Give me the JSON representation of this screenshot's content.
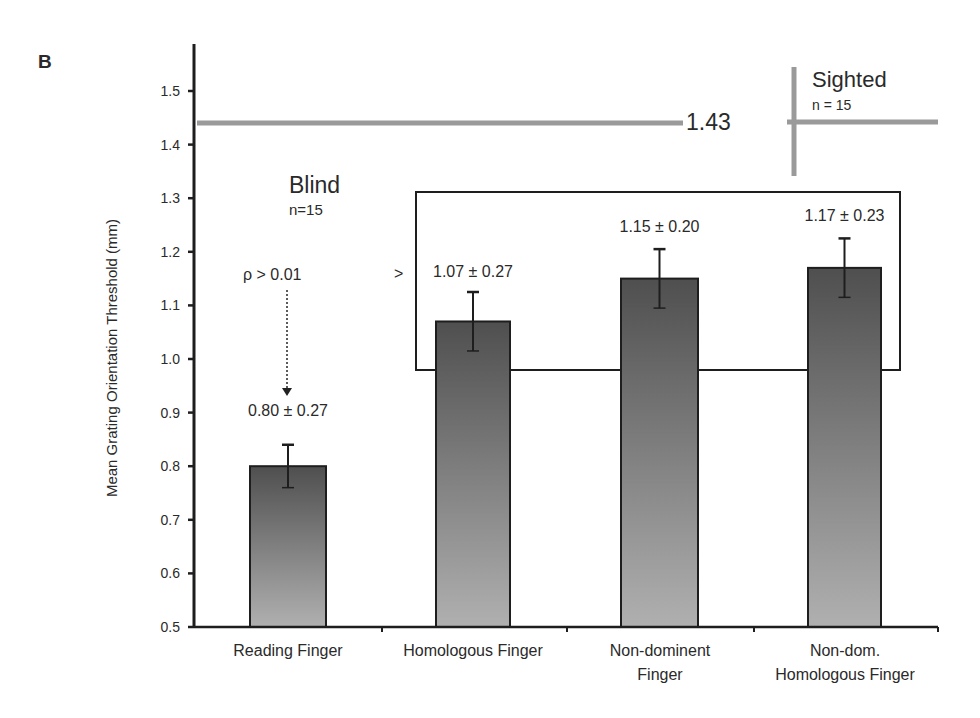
{
  "panel_label": "B",
  "chart_data": {
    "type": "bar",
    "title": "",
    "xlabel": "",
    "ylabel": "Mean Grating Orientation Threshold (mm)",
    "ylim": [
      0.5,
      1.55
    ],
    "yticks": [
      "0.5",
      "0.6",
      "0.7",
      "0.8",
      "0.9",
      "1.0",
      "1.1",
      "1.2",
      "1.3",
      "1.4",
      "1.5"
    ],
    "grid": false,
    "categories": [
      "Reading Finger",
      "Homologous Finger",
      "Non-dominent Finger",
      "Non-dom. Homologous Finger"
    ],
    "category_lines": [
      [
        "Reading Finger"
      ],
      [
        "Homologous Finger"
      ],
      [
        "Non-dominent",
        "Finger"
      ],
      [
        "Non-dom.",
        "Homologous Finger"
      ]
    ],
    "values": [
      0.8,
      1.07,
      1.15,
      1.17
    ],
    "errors_display": [
      0.27,
      0.27,
      0.2,
      0.23
    ],
    "error_bars_plotted": [
      0.04,
      0.055,
      0.055,
      0.055
    ],
    "data_labels": [
      "0.80 ± 0.27",
      "1.07 ± 0.27",
      "1.15 ± 0.20",
      "1.17 ± 0.23"
    ],
    "reference_line": {
      "value": 1.43,
      "label": "1.43",
      "group": "Sighted",
      "n": "n = 15"
    },
    "group_annotation": {
      "label": "Blind",
      "n": "n=15"
    },
    "annotations": [
      {
        "text": "ρ > 0.01",
        "type": "dotted-arrow",
        "target": "Reading Finger"
      },
      {
        "text": ">",
        "type": "comparison",
        "target": "boxed group (Homologous, Non-dominent, Non-dom. Homologous)"
      }
    ]
  },
  "colors": {
    "bar_top": "#4f4f4f",
    "bar_bottom": "#b0b0b0",
    "reference_line": "#9a9a9a",
    "axis": "#1e1e1e",
    "text": "#2a2a2a"
  }
}
